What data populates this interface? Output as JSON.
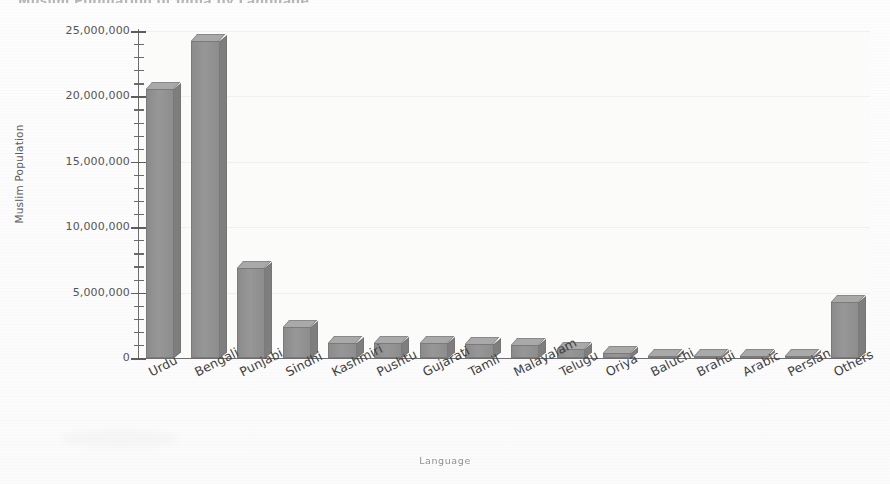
{
  "chart_data": {
    "type": "bar",
    "title": "Muslim Population of India by Language",
    "xlabel": "Language",
    "ylabel": "Muslim Population",
    "ylim": [
      0,
      25000000
    ],
    "ytick_labels": [
      "25,000,000",
      "20,000,000",
      "15,000,000",
      "10,000,000",
      "5,000,000",
      "0"
    ],
    "ytick_values": [
      25000000,
      20000000,
      15000000,
      10000000,
      5000000,
      0
    ],
    "ytick_interval": 5000000,
    "minor_tick_interval": 1000000,
    "grid": true,
    "legend": "none",
    "bar_style": "3d",
    "bar_color": "#919191",
    "categories": [
      "Urdu",
      "Bengali",
      "Punjabi",
      "Sindhi",
      "Kashmiri",
      "Pushtu",
      "Gujarati",
      "Tamil",
      "Malayalam",
      "Telugu",
      "Oriya",
      "Baluchi",
      "Brahui",
      "Arabic",
      "Persian",
      "Others"
    ],
    "values": [
      20600000,
      24200000,
      6900000,
      2400000,
      1150000,
      1150000,
      1150000,
      1050000,
      1000000,
      700000,
      400000,
      150000,
      120000,
      60000,
      40000,
      4300000
    ]
  },
  "axis": {
    "y_title": "Muslim Population",
    "x_title": "Language"
  }
}
